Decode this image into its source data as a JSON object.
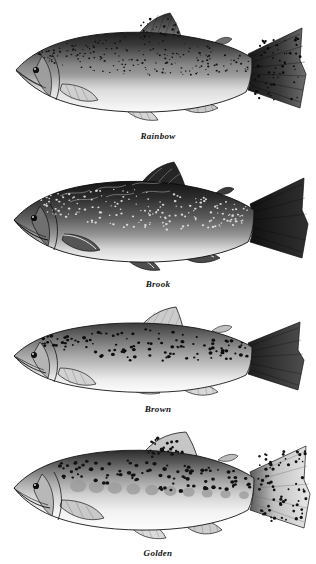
{
  "plate": {
    "background_color": "#ffffff",
    "ink_color": "#111111",
    "width": 316,
    "height": 564,
    "orientation": "fish facing left",
    "style": "grayscale field-guide engraving"
  },
  "fish": [
    {
      "id": "rainbow",
      "label": "Rainbow",
      "common_name": "Rainbow",
      "top": 4,
      "art_height": 126,
      "body": {
        "dorsal_color": "#2e2e2e",
        "mid_color": "#8d8d8d",
        "belly_color": "#f2f2f2",
        "outline_color": "#1a1a1a"
      },
      "markings": {
        "type": "dense-small-dark-spots",
        "spot_color": "#1d1d1d",
        "spot_count": 210,
        "spot_radius": 0.85,
        "has_lateral_band": true,
        "lateral_band_color": "#9a9a9a",
        "parr_marks": 0
      },
      "fins": {
        "tail_shade": "#242424",
        "tail_spotted": true,
        "dorsal_shade": "#3a3a3a",
        "dorsal_spotted": true
      }
    },
    {
      "id": "brook",
      "label": "Brook",
      "common_name": "Brook",
      "top": 152,
      "art_height": 126,
      "body": {
        "dorsal_color": "#232323",
        "mid_color": "#6a6a6a",
        "belly_color": "#ededed",
        "outline_color": "#151515"
      },
      "markings": {
        "type": "pale-halo-spots-on-dark-body",
        "spot_color": "#e8e8e8",
        "spot_count": 190,
        "spot_radius": 1.0,
        "has_lateral_band": false,
        "lateral_band_color": "#7a7a7a",
        "parr_marks": 0,
        "vermiculation": true
      },
      "fins": {
        "tail_shade": "#1c1c1c",
        "tail_spotted": false,
        "dorsal_shade": "#262626",
        "dorsal_spotted": false
      }
    },
    {
      "id": "brown",
      "label": "Brown",
      "common_name": "Brown",
      "top": 300,
      "art_height": 104,
      "body": {
        "dorsal_color": "#4a4a4a",
        "mid_color": "#a9a9a9",
        "belly_color": "#f6f6f6",
        "outline_color": "#1a1a1a"
      },
      "markings": {
        "type": "sparse-bold-black-spots",
        "spot_color": "#101010",
        "spot_count": 110,
        "spot_radius": 1.5,
        "has_lateral_band": false,
        "lateral_band_color": "#b0b0b0",
        "parr_marks": 0
      },
      "fins": {
        "tail_shade": "#2a2a2a",
        "tail_spotted": false,
        "dorsal_shade": "#b5b5b5",
        "dorsal_spotted": false
      }
    },
    {
      "id": "golden",
      "label": "Golden",
      "common_name": "Golden",
      "top": 428,
      "art_height": 118,
      "body": {
        "dorsal_color": "#3b3b3b",
        "mid_color": "#b4b4b4",
        "belly_color": "#fafafa",
        "outline_color": "#1a1a1a"
      },
      "markings": {
        "type": "parr-marks-with-bold-spots",
        "spot_color": "#141414",
        "spot_count": 95,
        "spot_radius": 1.7,
        "has_lateral_band": false,
        "lateral_band_color": "#9e9e9e",
        "parr_marks": 10,
        "parr_mark_color": "#9b9b9b"
      },
      "fins": {
        "tail_shade": "#d0d0d0",
        "tail_spotted": true,
        "dorsal_shade": "#c8c8c8",
        "dorsal_spotted": true
      }
    }
  ]
}
